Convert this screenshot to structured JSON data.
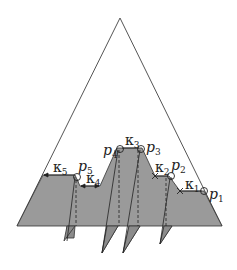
{
  "figure": {
    "colors": {
      "region_fill": "#9a9a9a",
      "fin_fill": "#8c8c8c",
      "outline": "#333333",
      "background": "#ffffff"
    },
    "points": [
      {
        "id": "p1",
        "base": "p",
        "sub": "1"
      },
      {
        "id": "p2",
        "base": "p",
        "sub": "2"
      },
      {
        "id": "p3",
        "base": "p",
        "sub": "3"
      },
      {
        "id": "p4",
        "base": "p",
        "sub": "4"
      },
      {
        "id": "p5",
        "base": "p",
        "sub": "5"
      }
    ],
    "kappas": [
      {
        "id": "k1",
        "base": "κ",
        "sub": "1"
      },
      {
        "id": "k2",
        "base": "κ",
        "sub": "2"
      },
      {
        "id": "k3",
        "base": "κ",
        "sub": "3"
      },
      {
        "id": "k4",
        "base": "κ",
        "sub": "4"
      },
      {
        "id": "k5",
        "base": "κ",
        "sub": "5"
      }
    ]
  }
}
